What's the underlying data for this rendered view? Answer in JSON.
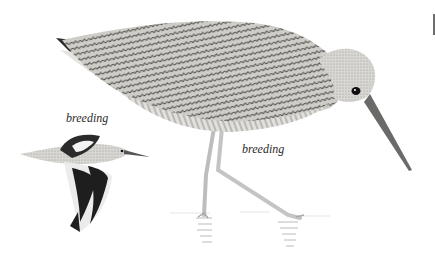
{
  "plate": {
    "subject": "wading bird illustration",
    "labels": {
      "flight_bird": "breeding",
      "standing_bird": "breeding"
    },
    "colors": {
      "background": "#ffffff",
      "plumage_light": "#d8d6d2",
      "plumage_mid": "#9a9894",
      "plumage_dark": "#2b2b2b",
      "legs": "#c9c9c9",
      "water": "#e4e6e8"
    }
  }
}
